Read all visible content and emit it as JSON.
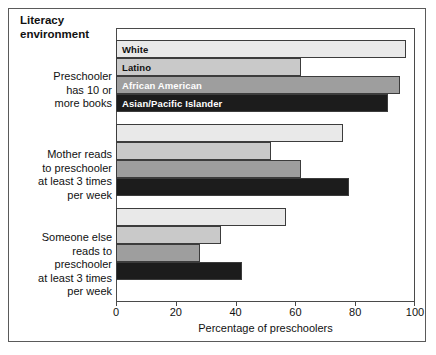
{
  "figure": {
    "title": "Literacy\nenvironment",
    "title_line1": "Literacy",
    "title_line2": "environment"
  },
  "axis": {
    "x_label": "Percentage of preschoolers",
    "x_ticks": [
      "0",
      "20",
      "40",
      "60",
      "80",
      "100"
    ]
  },
  "series_labels": {
    "white": "White",
    "latino": "Latino",
    "african_american": "African American",
    "asian_pacific_islander": "Asian/Pacific Islander"
  },
  "categories": {
    "c0_line1": "Preschooler",
    "c0_line2": "has 10 or",
    "c0_line3": "more books",
    "c1_line1": "Mother reads",
    "c1_line2": "to preschooler",
    "c1_line3": "at least 3 times",
    "c1_line4": "per week",
    "c2_line1": "Someone else",
    "c2_line2": "reads to",
    "c2_line3": "preschooler",
    "c2_line4": "at least 3 times",
    "c2_line5": "per week"
  },
  "colors": {
    "white": "#e9e9e9",
    "latino": "#c9c9c9",
    "african_american": "#9e9e9e",
    "asian_pacific_islander": "#1c1c1c",
    "bar_outline": "#3c3c3c",
    "frame": "#5a5a5a",
    "plot_frame": "#4a4a4a",
    "text": "#111111",
    "background": "#ffffff"
  },
  "chart_data": {
    "type": "bar",
    "orientation": "horizontal",
    "title": "Literacy environment",
    "xlabel": "Percentage of preschoolers",
    "ylabel": "",
    "xlim": [
      0,
      100
    ],
    "xticks": [
      0,
      20,
      40,
      60,
      80,
      100
    ],
    "grid": false,
    "legend": "in-bar labels on first group",
    "categories": [
      "Preschooler has 10 or more books",
      "Mother reads to preschooler at least 3 times per week",
      "Someone else reads to preschooler at least 3 times per week"
    ],
    "series": [
      {
        "name": "White",
        "color": "#e9e9e9",
        "values": [
          97,
          76,
          57
        ]
      },
      {
        "name": "Latino",
        "color": "#c9c9c9",
        "values": [
          62,
          52,
          35
        ]
      },
      {
        "name": "African American",
        "color": "#9e9e9e",
        "values": [
          95,
          62,
          28
        ]
      },
      {
        "name": "Asian/Pacific Islander",
        "color": "#1c1c1c",
        "values": [
          91,
          78,
          42
        ]
      }
    ]
  }
}
